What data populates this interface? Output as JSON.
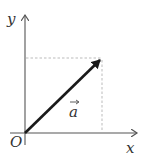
{
  "diagram": {
    "type": "vector-on-axes",
    "axes": {
      "x_label": "x",
      "y_label": "y",
      "origin_label": "O"
    },
    "vector": {
      "label": "a",
      "label_has_arrow": true,
      "from": "O",
      "direction": "up-right"
    },
    "projections": {
      "style": "dashed",
      "to_x_axis": true,
      "to_y_axis": true
    },
    "colors": {
      "axis": "#555555",
      "vector": "#1a1a1a",
      "dashed": "#aaaaaa",
      "text": "#333333"
    }
  }
}
